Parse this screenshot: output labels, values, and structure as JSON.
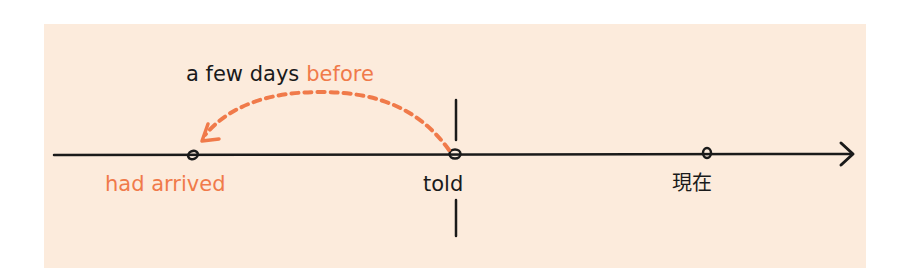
{
  "diagram": {
    "type": "timeline",
    "caption": {
      "prefix": "a few days",
      "emphasis": "before"
    },
    "points": [
      {
        "label": "had arrived",
        "x": 192,
        "style": "accent"
      },
      {
        "label": "told",
        "x": 455,
        "style": "normal"
      },
      {
        "label": "現在",
        "x": 707,
        "style": "normal"
      }
    ],
    "colors": {
      "background": "#fcebdc",
      "accent": "#f07a4a",
      "ink": "#1a1a1a"
    },
    "icons": {
      "timeline_arrow": "arrow-right-icon",
      "back_arrow": "dashed-curved-arrow-icon"
    }
  }
}
